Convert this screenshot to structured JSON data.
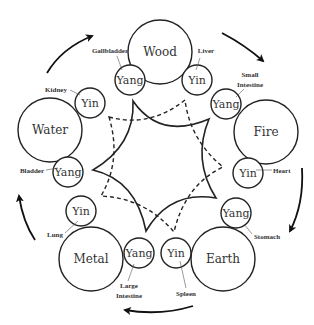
{
  "diagram": {
    "elements": [
      {
        "name": "Wood",
        "yin": {
          "label": "Yin",
          "organ": "Liver"
        },
        "yang": {
          "label": "Yang",
          "organ": "Gallbladder"
        }
      },
      {
        "name": "Fire",
        "yin": {
          "label": "Yin",
          "organ": "Heart"
        },
        "yang": {
          "label": "Yang",
          "organ": "Small Intestine"
        }
      },
      {
        "name": "Earth",
        "yin": {
          "label": "Yin",
          "organ": "Spleen"
        },
        "yang": {
          "label": "Yang",
          "organ": "Stomach"
        }
      },
      {
        "name": "Metal",
        "yin": {
          "label": "Yin",
          "organ": "Lung"
        },
        "yang": {
          "label": "Yang",
          "organ": "Large Intestine"
        }
      },
      {
        "name": "Water",
        "yin": {
          "label": "Yin",
          "organ": "Kidney"
        },
        "yang": {
          "label": "Yang",
          "organ": "Bladder"
        }
      }
    ],
    "organ_lines": {
      "small_intestine_1": "Small",
      "small_intestine_2": "Intestine",
      "large_intestine_1": "Large",
      "large_intestine_2": "Intestine"
    },
    "cycle_direction": "clockwise",
    "center": {
      "solid_star": "generating/controlling cycle (solid)",
      "dashed_star": "dashed cycle"
    }
  }
}
